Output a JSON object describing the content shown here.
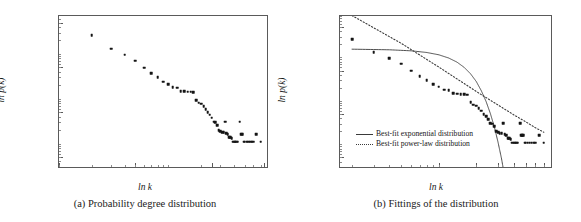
{
  "figure": {
    "panels": [
      {
        "id": "a",
        "caption": "(a) Probability degree distribution",
        "xlabel": "ln k",
        "ylabel": "ln p(k)",
        "y_ticks": [
          "0.5000",
          "0.0500",
          "0.0050",
          "0.0005"
        ],
        "x_ticks": [
          "1",
          "5",
          "25",
          "75"
        ]
      },
      {
        "id": "b",
        "caption": "(b) Fittings of the distribution",
        "xlabel": "ln k",
        "ylabel": "ln p(k)",
        "y_ticks": [
          "0.5000",
          "0.0500",
          "0.0050",
          "0.0005"
        ],
        "x_ticks": [
          "10",
          "20",
          "30",
          "40",
          "50",
          "60",
          "70"
        ],
        "legend": [
          {
            "label": "Best-fit exponential distribution",
            "style": "solid"
          },
          {
            "label": "Best-fit power-law distribution",
            "style": "dotted"
          }
        ]
      }
    ]
  },
  "chart_data": [
    {
      "type": "scatter",
      "title": "(a) Probability degree distribution",
      "xlabel": "ln k",
      "ylabel": "ln p(k)",
      "xscale": "log",
      "yscale": "log",
      "xlim": [
        1,
        80
      ],
      "ylim": [
        0.0003,
        0.7
      ],
      "xticks": [
        1,
        5,
        25,
        75
      ],
      "xticklabels": [
        "1",
        "5",
        "25",
        "75"
      ],
      "yticks": [
        0.5,
        0.05,
        0.005,
        0.0005
      ],
      "yticklabels": [
        "0.5000",
        "0.0500",
        "0.0050",
        "0.0005"
      ],
      "grid": false,
      "legend": "none",
      "marker": "square",
      "x": [
        2,
        3,
        4,
        5,
        6,
        7,
        8,
        9,
        10,
        11,
        12,
        13,
        14,
        15,
        16,
        17,
        18,
        19,
        20,
        21,
        22,
        23,
        24,
        25,
        26,
        27,
        28,
        29,
        30,
        31,
        32,
        33,
        34,
        35,
        36,
        37,
        38,
        39,
        40,
        41,
        42,
        43,
        45,
        46,
        47,
        48,
        49,
        50,
        52,
        54,
        56,
        58,
        60,
        64,
        70
      ],
      "y": [
        0.26,
        0.13,
        0.095,
        0.071,
        0.049,
        0.037,
        0.03,
        0.024,
        0.021,
        0.018,
        0.0175,
        0.0148,
        0.0145,
        0.0142,
        0.0142,
        0.014,
        0.0092,
        0.0082,
        0.0078,
        0.0068,
        0.0059,
        0.005,
        0.0044,
        0.0038,
        0.0031,
        0.003,
        0.0026,
        0.002,
        0.0019,
        0.0018,
        0.0018,
        0.0031,
        0.0017,
        0.0016,
        0.0014,
        0.0014,
        0.0013,
        0.0011,
        0.0011,
        0.0011,
        0.0011,
        0.0011,
        0.0031,
        0.0016,
        0.0016,
        0.0016,
        0.0011,
        0.0011,
        0.0011,
        0.0011,
        0.0011,
        0.0011,
        0.0011,
        0.0016,
        0.0011
      ]
    },
    {
      "type": "scatter",
      "title": "(b) Fittings of the distribution",
      "xlabel": "ln k",
      "ylabel": "ln p(k)",
      "xscale": "log",
      "yscale": "log",
      "xlim": [
        1.6,
        80
      ],
      "ylim": [
        0.0003,
        0.9
      ],
      "xticks": [
        10,
        20,
        30,
        40,
        50,
        60,
        70
      ],
      "xticklabels": [
        "10",
        "20",
        "30",
        "40",
        "50",
        "60",
        "70"
      ],
      "yticks": [
        0.5,
        0.05,
        0.005,
        0.0005
      ],
      "yticklabels": [
        "0.5000",
        "0.0500",
        "0.0050",
        "0.0005"
      ],
      "grid": false,
      "legend": "lower left",
      "marker": "square",
      "x": [
        2,
        3,
        4,
        5,
        6,
        7,
        8,
        9,
        10,
        11,
        12,
        13,
        14,
        15,
        16,
        17,
        18,
        19,
        20,
        21,
        22,
        23,
        24,
        25,
        26,
        27,
        28,
        29,
        30,
        31,
        32,
        33,
        34,
        35,
        36,
        37,
        38,
        39,
        40,
        41,
        42,
        43,
        45,
        46,
        47,
        48,
        49,
        50,
        52,
        54,
        56,
        58,
        60,
        64,
        70
      ],
      "y": [
        0.26,
        0.13,
        0.095,
        0.071,
        0.049,
        0.037,
        0.03,
        0.024,
        0.021,
        0.018,
        0.0175,
        0.0148,
        0.0145,
        0.0142,
        0.0142,
        0.014,
        0.0092,
        0.0082,
        0.0078,
        0.0068,
        0.0059,
        0.005,
        0.0044,
        0.0038,
        0.0031,
        0.003,
        0.0026,
        0.002,
        0.0019,
        0.0018,
        0.0018,
        0.0031,
        0.0017,
        0.0016,
        0.0014,
        0.0014,
        0.0013,
        0.0011,
        0.0011,
        0.0011,
        0.0011,
        0.0011,
        0.0031,
        0.0016,
        0.0016,
        0.0016,
        0.0011,
        0.0011,
        0.0011,
        0.0011,
        0.0011,
        0.0011,
        0.0011,
        0.0016,
        0.0011
      ],
      "series": [
        {
          "name": "Best-fit exponential distribution",
          "style": "solid",
          "x": [
            2,
            4,
            6,
            8,
            10,
            12,
            14,
            16,
            18,
            20,
            22,
            24,
            26,
            28,
            30,
            32,
            34,
            36,
            38
          ],
          "y": [
            0.155,
            0.15,
            0.142,
            0.13,
            0.115,
            0.097,
            0.078,
            0.059,
            0.042,
            0.028,
            0.017,
            0.0097,
            0.0051,
            0.0025,
            0.0011,
            0.00046,
            0.00017,
            6e-05,
            2e-05
          ]
        },
        {
          "name": "Best-fit power-law distribution",
          "style": "dotted",
          "x": [
            2,
            5,
            10,
            20,
            30,
            40,
            50,
            60,
            70
          ],
          "y": [
            0.92,
            0.21,
            0.06,
            0.0165,
            0.008,
            0.0048,
            0.0033,
            0.0024,
            0.0019
          ]
        }
      ]
    }
  ]
}
